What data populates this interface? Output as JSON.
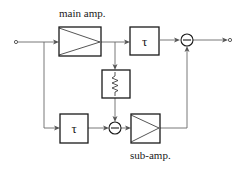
{
  "diagram": {
    "labels": {
      "main_amp": "main amp.",
      "sub_amp": "sub-amp.",
      "delay_top": "τ",
      "delay_bottom": "τ"
    },
    "blocks": [
      {
        "id": "main-amp",
        "type": "amplifier",
        "label": "main amp."
      },
      {
        "id": "delay-top",
        "type": "delay",
        "label": "τ"
      },
      {
        "id": "attenuator",
        "type": "resistor",
        "label": ""
      },
      {
        "id": "delay-bottom",
        "type": "delay",
        "label": "τ"
      },
      {
        "id": "sum-bottom",
        "type": "subtractor",
        "label": "−"
      },
      {
        "id": "sub-amp",
        "type": "amplifier",
        "label": "sub-amp."
      },
      {
        "id": "sum-top",
        "type": "subtractor",
        "label": "−"
      }
    ],
    "connections": [
      [
        "input",
        "main-amp"
      ],
      [
        "input",
        "delay-bottom"
      ],
      [
        "main-amp",
        "delay-top"
      ],
      [
        "main-amp",
        "attenuator"
      ],
      [
        "attenuator",
        "sum-bottom"
      ],
      [
        "delay-bottom",
        "sum-bottom"
      ],
      [
        "sum-bottom",
        "sub-amp"
      ],
      [
        "delay-top",
        "sum-top"
      ],
      [
        "sub-amp",
        "sum-top"
      ],
      [
        "sum-top",
        "output"
      ]
    ],
    "colors": {
      "line": "#1a1a1a",
      "wire": "#6a6a6a",
      "background": "#ffffff"
    }
  }
}
